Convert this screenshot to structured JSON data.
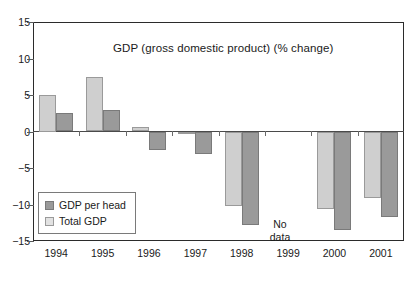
{
  "chart_data": {
    "type": "bar",
    "title": "GDP (gross domestic product) (% change)",
    "xlabel": "",
    "ylabel": "",
    "ylim": [
      -15,
      15
    ],
    "yticks": [
      15,
      10,
      5,
      0,
      -5,
      -10,
      -15
    ],
    "ytick_labels": [
      "15",
      "10",
      "5",
      "0",
      "−5",
      "−10",
      "−15"
    ],
    "grid": false,
    "legend_position": "lower-left-inside",
    "categories": [
      "1994",
      "1995",
      "1996",
      "1997",
      "1998",
      "1999",
      "2000",
      "2001"
    ],
    "series": [
      {
        "name": "Total GDP",
        "color": "#cfcfcf",
        "values": [
          5.0,
          7.4,
          0.6,
          -0.2,
          -10.2,
          null,
          -10.5,
          -9.1
        ]
      },
      {
        "name": "GDP per head",
        "color": "#9a9a9a",
        "values": [
          2.5,
          2.9,
          -2.4,
          -3.0,
          -12.7,
          null,
          -13.4,
          -11.6
        ]
      }
    ],
    "annotations": [
      {
        "text_line1": "No",
        "text_line2": "data",
        "at_category": "1999"
      }
    ]
  },
  "legend": {
    "items": [
      {
        "label": "GDP per head",
        "swatch": "dark-gray"
      },
      {
        "label": "Total GDP",
        "swatch": "light-gray"
      }
    ]
  }
}
